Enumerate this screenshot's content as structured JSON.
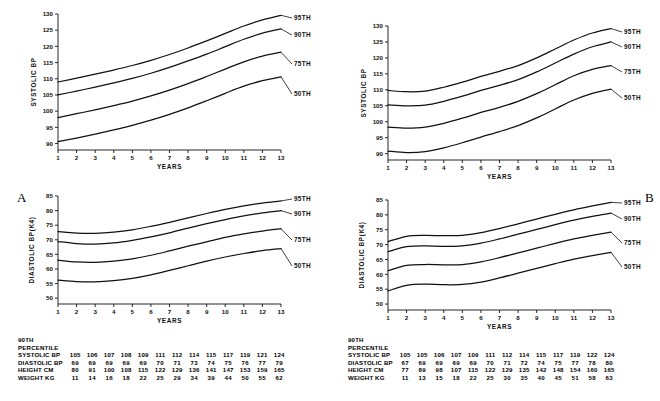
{
  "figure": {
    "panel_a_letter": "A",
    "panel_b_letter": "B"
  },
  "charts": [
    {
      "id": "panel-a-systolic",
      "chart_data": {
        "type": "line",
        "title": "",
        "xlabel": "YEARS",
        "ylabel": "SYSTOLIC BP",
        "xlim": [
          1,
          13
        ],
        "ylim": [
          88,
          130
        ],
        "yticks": [
          90,
          95,
          100,
          105,
          110,
          115,
          120,
          125,
          130
        ],
        "xticks": [
          1,
          2,
          3,
          4,
          5,
          6,
          7,
          8,
          9,
          10,
          11,
          12,
          13
        ],
        "grid": false,
        "legend": "right-inline",
        "x": [
          1,
          2,
          3,
          4,
          5,
          6,
          7,
          8,
          9,
          10,
          11,
          12,
          13
        ],
        "series": [
          {
            "name": "95TH",
            "values": [
              109.0,
              110.2,
              111.4,
              112.7,
              114.1,
              115.7,
              117.5,
              119.5,
              121.7,
              124.0,
              126.3,
              128.2,
              129.6
            ]
          },
          {
            "name": "90TH",
            "values": [
              105.0,
              106.2,
              107.4,
              108.7,
              110.1,
              111.7,
              113.5,
              115.5,
              117.6,
              119.9,
              122.2,
              124.1,
              125.4
            ]
          },
          {
            "name": "75TH",
            "values": [
              98.0,
              99.2,
              100.4,
              101.7,
              103.1,
              104.7,
              106.5,
              108.5,
              110.7,
              113.0,
              115.2,
              117.0,
              118.2
            ]
          },
          {
            "name": "50TH",
            "values": [
              90.6,
              91.7,
              92.9,
              94.2,
              95.6,
              97.2,
              99.0,
              101.0,
              103.2,
              105.5,
              107.7,
              109.4,
              110.6
            ]
          }
        ]
      }
    },
    {
      "id": "panel-a-diastolic",
      "chart_data": {
        "type": "line",
        "title": "",
        "xlabel": "YEARS",
        "ylabel": "DIASTOLIC BP(K4)",
        "xlim": [
          1,
          13
        ],
        "ylim": [
          48,
          85
        ],
        "yticks": [
          50,
          55,
          60,
          65,
          70,
          75,
          80,
          85
        ],
        "xticks": [
          1,
          2,
          3,
          4,
          5,
          6,
          7,
          8,
          9,
          10,
          11,
          12,
          13
        ],
        "grid": false,
        "legend": "right-inline",
        "x": [
          1,
          2,
          3,
          4,
          5,
          6,
          7,
          8,
          9,
          10,
          11,
          12,
          13
        ],
        "series": [
          {
            "name": "95TH",
            "values": [
              72.8,
              72.3,
              72.2,
              72.6,
              73.4,
              74.6,
              76.0,
              77.5,
              79.0,
              80.4,
              81.6,
              82.6,
              83.3
            ]
          },
          {
            "name": "90TH",
            "values": [
              69.4,
              68.7,
              68.5,
              68.9,
              69.8,
              71.0,
              72.4,
              74.0,
              75.5,
              76.9,
              78.2,
              79.2,
              80.0
            ]
          },
          {
            "name": "75TH",
            "values": [
              63.0,
              62.4,
              62.3,
              62.7,
              63.5,
              64.7,
              66.2,
              67.8,
              69.3,
              70.8,
              72.0,
              73.0,
              73.8
            ]
          },
          {
            "name": "50TH",
            "values": [
              56.2,
              55.7,
              55.6,
              56.0,
              56.8,
              58.0,
              59.5,
              61.1,
              62.7,
              64.1,
              65.3,
              66.3,
              67.0
            ]
          }
        ]
      },
      "table": {
        "header_lines": [
          "90TH",
          "PERCENTILE"
        ],
        "rows": [
          {
            "label": "SYSTOLIC BP",
            "values": [
              105,
              106,
              107,
              108,
              109,
              111,
              112,
              114,
              115,
              117,
              119,
              121,
              124
            ]
          },
          {
            "label": "DIASTOLIC BP",
            "values": [
              69,
              69,
              69,
              69,
              69,
              70,
              71,
              73,
              74,
              75,
              76,
              77,
              79
            ]
          },
          {
            "label": "HEIGHT CM",
            "values": [
              80,
              91,
              100,
              108,
              115,
              122,
              129,
              136,
              141,
              147,
              153,
              159,
              165
            ]
          },
          {
            "label": "WEIGHT KG",
            "values": [
              11,
              14,
              16,
              18,
              22,
              25,
              29,
              34,
              39,
              44,
              50,
              55,
              62
            ]
          }
        ]
      }
    },
    {
      "id": "panel-b-systolic",
      "chart_data": {
        "type": "line",
        "title": "",
        "xlabel": "YEARS",
        "ylabel": "SYSTOLIC BP",
        "xlim": [
          1,
          13
        ],
        "ylim": [
          88,
          130
        ],
        "yticks": [
          90,
          95,
          100,
          105,
          110,
          115,
          120,
          125,
          130
        ],
        "xticks": [
          1,
          2,
          3,
          4,
          5,
          6,
          7,
          8,
          9,
          10,
          11,
          12,
          13
        ],
        "grid": false,
        "legend": "right-inline",
        "x": [
          1,
          2,
          3,
          4,
          5,
          6,
          7,
          8,
          9,
          10,
          11,
          12,
          13
        ],
        "series": [
          {
            "name": "95TH",
            "values": [
              109.8,
              109.4,
              109.6,
              110.8,
              112.4,
              114.2,
              115.8,
              117.6,
              120.0,
              122.8,
              125.6,
              127.8,
              129.2
            ]
          },
          {
            "name": "90TH",
            "values": [
              105.3,
              105.0,
              105.2,
              106.4,
              108.0,
              109.8,
              111.4,
              113.2,
              115.6,
              118.4,
              121.2,
              123.5,
              125.0
            ]
          },
          {
            "name": "75TH",
            "values": [
              98.3,
              98.0,
              98.3,
              99.5,
              101.1,
              102.9,
              104.5,
              106.4,
              108.8,
              111.6,
              114.4,
              116.4,
              117.6
            ]
          },
          {
            "name": "50TH",
            "values": [
              90.8,
              90.3,
              90.6,
              91.8,
              93.4,
              95.2,
              96.9,
              98.8,
              101.2,
              104.0,
              106.8,
              108.9,
              110.2
            ]
          }
        ]
      }
    },
    {
      "id": "panel-b-diastolic",
      "chart_data": {
        "type": "line",
        "title": "",
        "xlabel": "YEARS",
        "ylabel": "DIASTOLIC BP(K4)",
        "xlim": [
          1,
          13
        ],
        "ylim": [
          48,
          85
        ],
        "yticks": [
          50,
          55,
          60,
          65,
          70,
          75,
          80,
          85
        ],
        "xticks": [
          1,
          2,
          3,
          4,
          5,
          6,
          7,
          8,
          9,
          10,
          11,
          12,
          13
        ],
        "grid": false,
        "legend": "right-inline",
        "x": [
          1,
          2,
          3,
          4,
          5,
          6,
          7,
          8,
          9,
          10,
          11,
          12,
          13
        ],
        "series": [
          {
            "name": "95TH",
            "values": [
              71.0,
              72.8,
              73.1,
              73.0,
              73.1,
              74.0,
              75.4,
              77.0,
              78.6,
              80.2,
              81.7,
              83.0,
              84.2
            ]
          },
          {
            "name": "90TH",
            "values": [
              67.6,
              69.3,
              69.6,
              69.4,
              69.6,
              70.5,
              71.9,
              73.5,
              75.1,
              76.7,
              78.2,
              79.5,
              80.6
            ]
          },
          {
            "name": "75TH",
            "values": [
              61.2,
              63.0,
              63.3,
              63.2,
              63.3,
              64.2,
              65.6,
              67.2,
              68.8,
              70.4,
              71.9,
              73.1,
              74.2
            ]
          },
          {
            "name": "50TH",
            "values": [
              54.4,
              56.3,
              56.7,
              56.5,
              56.6,
              57.4,
              58.8,
              60.4,
              62.0,
              63.6,
              65.1,
              66.3,
              67.4
            ]
          }
        ]
      },
      "table": {
        "header_lines": [
          "90TH",
          "PERCENTILE"
        ],
        "rows": [
          {
            "label": "SYSTOLIC BP",
            "values": [
              105,
              105,
              106,
              107,
              109,
              111,
              112,
              114,
              115,
              117,
              119,
              122,
              124
            ]
          },
          {
            "label": "DIASTOLIC BP",
            "values": [
              67,
              69,
              69,
              69,
              69,
              70,
              71,
              72,
              74,
              75,
              77,
              78,
              80
            ]
          },
          {
            "label": "HEIGHT CM",
            "values": [
              77,
              89,
              98,
              107,
              115,
              122,
              129,
              135,
              142,
              148,
              154,
              160,
              165
            ]
          },
          {
            "label": "WEIGHT KG",
            "values": [
              11,
              13,
              15,
              18,
              22,
              25,
              30,
              35,
              40,
              45,
              51,
              58,
              63
            ]
          }
        ]
      }
    }
  ]
}
